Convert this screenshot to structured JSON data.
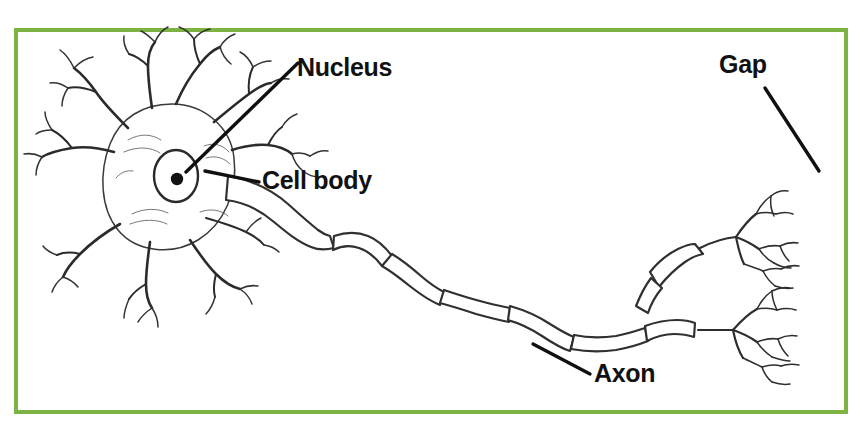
{
  "figure": {
    "kind": "neuron-anatomy-diagram",
    "background_color": "#ffffff",
    "frame_border_color": "#7cb342",
    "ink_color": "#1a1a1a"
  },
  "labels": {
    "nucleus": "Nucleus",
    "cell_body": "Cell body",
    "gap": "Gap",
    "axon": "Axon"
  },
  "leader_lines": [
    {
      "name": "nucleus-leader",
      "x1": 186,
      "y1": 172,
      "x2": 298,
      "y2": 63
    },
    {
      "name": "cell-body-leader",
      "x1": 205,
      "y1": 171,
      "x2": 259,
      "y2": 182
    },
    {
      "name": "gap-leader",
      "x1": 765,
      "y1": 88,
      "x2": 819,
      "y2": 171
    },
    {
      "name": "axon-leader",
      "x1": 533,
      "y1": 344,
      "x2": 590,
      "y2": 374
    }
  ],
  "parts": {
    "soma": {
      "name": "cell-body",
      "cx": 170,
      "cy": 175,
      "rx": 62,
      "ry": 72
    },
    "nucleus": {
      "name": "nucleus",
      "cx": 176,
      "cy": 176,
      "rx": 22,
      "ry": 26
    },
    "nucleolus": {
      "name": "nucleolus",
      "cx": 177,
      "cy": 179,
      "r": 6
    },
    "dendrite_count": 9,
    "myelin_segment_count": 8,
    "terminal_branch_clusters": 2
  }
}
